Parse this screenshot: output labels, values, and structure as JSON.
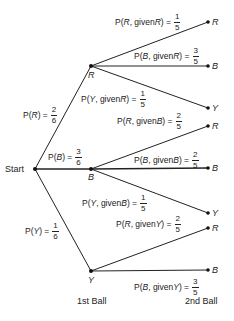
{
  "diagram": {
    "type": "probability-tree",
    "start_label": "Start",
    "level_labels": {
      "first": "1st Ball",
      "second": "2nd Ball"
    },
    "first_level": [
      {
        "node": "R",
        "prob_label": "P(R) = ",
        "event": "R",
        "num": "2",
        "den": "6"
      },
      {
        "node": "B",
        "prob_label": "P(B) = ",
        "event": "B",
        "num": "3",
        "den": "6"
      },
      {
        "node": "Y",
        "prob_label": "P(Y) = ",
        "event": "Y",
        "num": "1",
        "den": "6"
      }
    ],
    "second_level": {
      "R": [
        {
          "node": "R",
          "outcome": "R",
          "given": "R",
          "num": "1",
          "den": "5"
        },
        {
          "node": "B",
          "outcome": "B",
          "given": "R",
          "num": "3",
          "den": "5"
        },
        {
          "node": "Y",
          "outcome": "Y",
          "given": "R",
          "num": "1",
          "den": "5"
        }
      ],
      "B": [
        {
          "node": "R",
          "outcome": "R",
          "given": "B",
          "num": "2",
          "den": "5"
        },
        {
          "node": "B",
          "outcome": "B",
          "given": "B",
          "num": "2",
          "den": "5"
        },
        {
          "node": "Y",
          "outcome": "Y",
          "given": "B",
          "num": "1",
          "den": "5"
        }
      ],
      "Y": [
        {
          "node": "R",
          "outcome": "R",
          "given": "Y",
          "num": "2",
          "den": "5"
        },
        {
          "node": "B",
          "outcome": "B",
          "given": "Y",
          "num": "3",
          "den": "5"
        }
      ]
    },
    "text": {
      "P": "P(",
      "given": ", given ",
      "close": ") = ",
      "eq": ") = "
    }
  }
}
